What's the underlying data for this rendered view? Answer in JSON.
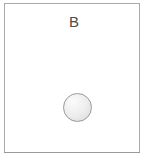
{
  "diagram": {
    "panel_label": "B",
    "colors": {
      "background": "#ffffff",
      "box_border": "#aaaaaa",
      "box_border_bottom": "#9a9a9a",
      "label_text": "#4d4d4d",
      "circle_border": "#999999",
      "circle_fill_light": "#fbfbfb",
      "circle_fill_mid": "#ececec",
      "circle_fill_dark": "#d7d7d7"
    }
  }
}
